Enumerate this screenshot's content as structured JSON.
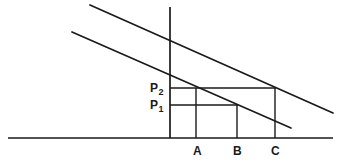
{
  "figure": {
    "type": "geometric-line-diagram",
    "background_color": "#ffffff",
    "stroke_color": "#1a1a1a",
    "text_color": "#1a1a1a",
    "width": 342,
    "height": 167,
    "point_labels": [
      {
        "id": "P2",
        "base": "P",
        "subscript": "2",
        "x": 150,
        "y": 82
      },
      {
        "id": "P1",
        "base": "P",
        "subscript": "1",
        "x": 150,
        "y": 99
      }
    ],
    "axis_labels": [
      {
        "id": "A",
        "text": "A",
        "x": 193,
        "y": 145
      },
      {
        "id": "B",
        "text": "B",
        "x": 233,
        "y": 145
      },
      {
        "id": "C",
        "text": "C",
        "x": 271,
        "y": 145
      }
    ],
    "lines": {
      "baseline": {
        "name": "horizontal-baseline",
        "x1": 8,
        "y1": 138,
        "x2": 333,
        "y2": 138,
        "width": 1.6
      },
      "vertical_axis": {
        "name": "vertical-axis",
        "x1": 170,
        "y1": 7,
        "x2": 170,
        "y2": 138,
        "width": 1.6
      },
      "upper_diagonal": {
        "name": "upper-demand-line",
        "x1": 90,
        "y1": 5,
        "x2": 333,
        "y2": 113,
        "width": 1.6
      },
      "lower_diagonal": {
        "name": "lower-demand-line",
        "x1": 72,
        "y1": 32,
        "x2": 291,
        "y2": 128,
        "width": 1.6
      },
      "p2_horizontal": {
        "name": "p2-level-line",
        "x1": 170,
        "y1": 88,
        "x2": 275,
        "y2": 88,
        "width": 1.4
      },
      "p1_horizontal": {
        "name": "p1-level-line",
        "x1": 170,
        "y1": 105,
        "x2": 237,
        "y2": 105,
        "width": 1.4
      },
      "vertical_a": {
        "name": "vertical-line-a",
        "x1": 196,
        "y1": 88,
        "x2": 196,
        "y2": 138,
        "width": 1.4
      },
      "vertical_b": {
        "name": "vertical-line-b",
        "x1": 237,
        "y1": 105,
        "x2": 237,
        "y2": 138,
        "width": 1.4
      },
      "vertical_c": {
        "name": "vertical-line-c",
        "x1": 275,
        "y1": 88,
        "x2": 275,
        "y2": 138,
        "width": 1.4
      }
    }
  }
}
